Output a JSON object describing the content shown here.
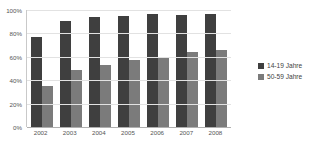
{
  "chart_data": {
    "type": "bar",
    "title": "",
    "subtitle": "",
    "xlabel": "",
    "ylabel": "",
    "categories": [
      "2002",
      "2003",
      "2004",
      "2005",
      "2006",
      "2007",
      "2008"
    ],
    "series": [
      {
        "name": "14-19 Jahre",
        "color": "#3f3f3f",
        "values": [
          77,
          91,
          94,
          95,
          97,
          96,
          97
        ]
      },
      {
        "name": "50-59 Jahre",
        "color": "#7b7b7b",
        "values": [
          35,
          49,
          53,
          57,
          60,
          64,
          66
        ]
      }
    ],
    "ylim": [
      0,
      100
    ],
    "ytick_labels": [
      "0%",
      "20%",
      "40%",
      "60%",
      "80%",
      "100%"
    ],
    "ytick_values": [
      0,
      20,
      40,
      60,
      80,
      100
    ],
    "grid": true,
    "legend_position": "right",
    "value_suffix": "%"
  },
  "legend": {
    "items": [
      {
        "label": "14-19 Jahre",
        "color": "#3f3f3f"
      },
      {
        "label": "50-59 Jahre",
        "color": "#7b7b7b"
      }
    ]
  }
}
